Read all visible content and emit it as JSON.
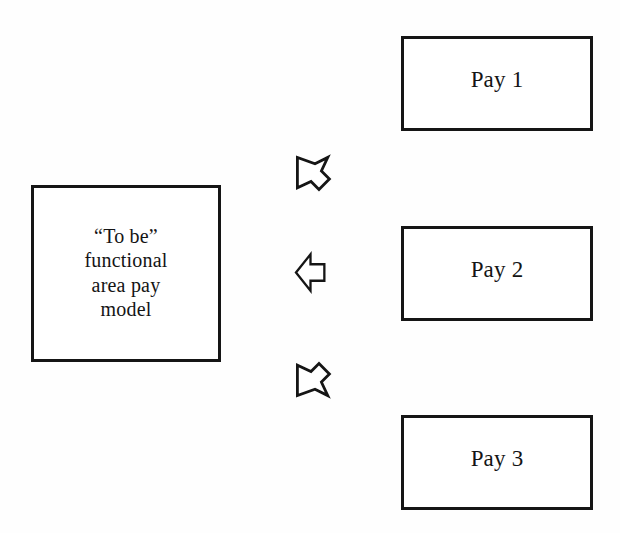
{
  "diagram": {
    "background_color": "#fefefe",
    "line_color": "#151515",
    "text_color": "#141414",
    "model_node": {
      "id": "to-be-model",
      "label": "“To be”\nfunctional\narea pay\nmodel",
      "label_lines": [
        "“To be”",
        "functional",
        "area pay",
        "model"
      ]
    },
    "pay_nodes": [
      {
        "id": "pay-1",
        "label": "Pay 1"
      },
      {
        "id": "pay-2",
        "label": "Pay 2"
      },
      {
        "id": "pay-3",
        "label": "Pay 3"
      }
    ],
    "connectors": [
      {
        "id": "connector-pay-1",
        "icon": "arrow-up-left-icon",
        "direction": "up-left",
        "from": "Pay 1",
        "to": "“To be” functional area pay model"
      },
      {
        "id": "connector-pay-2",
        "icon": "arrow-left-icon",
        "direction": "left",
        "from": "Pay 2",
        "to": "“To be” functional area pay model"
      },
      {
        "id": "connector-pay-3",
        "icon": "arrow-down-left-icon",
        "direction": "down-left",
        "from": "Pay 3",
        "to": "“To be” functional area pay model"
      }
    ]
  }
}
